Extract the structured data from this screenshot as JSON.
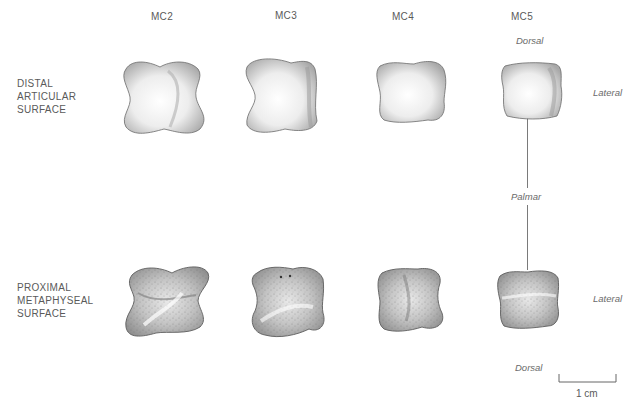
{
  "columns": [
    {
      "id": "mc2",
      "label": "MC2"
    },
    {
      "id": "mc3",
      "label": "MC3"
    },
    {
      "id": "mc4",
      "label": "MC4"
    },
    {
      "id": "mc5",
      "label": "MC5"
    }
  ],
  "rows": [
    {
      "id": "distal",
      "lines": [
        "DISTAL",
        "ARTICULAR",
        "SURFACE"
      ]
    },
    {
      "id": "proximal",
      "lines": [
        "PROXIMAL",
        "METAPHYSEAL",
        "SURFACE"
      ]
    }
  ],
  "orientation": {
    "top_dorsal": "Dorsal",
    "top_lateral": "Lateral",
    "middle_palmar": "Palmar",
    "bottom_lateral": "Lateral",
    "bottom_dorsal": "Dorsal"
  },
  "scale_bar": {
    "label": "1 cm"
  },
  "colors": {
    "background": "#ffffff",
    "outline": "#6b6b6b",
    "shade_dark": "#9a9a9a",
    "shade_light": "#f4f4f4",
    "text": "#5a5a5a"
  }
}
